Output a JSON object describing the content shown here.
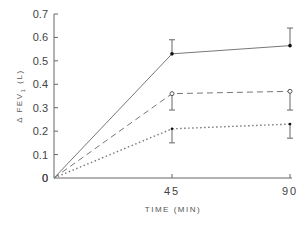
{
  "chart_data": {
    "type": "line",
    "title": "",
    "xlabel": "TIME (MIN)",
    "ylabel": "Δ FEV1 (L)",
    "x": [
      0,
      45,
      90
    ],
    "x_tick_labels": [
      "0",
      "45",
      "90"
    ],
    "y_tick_labels": [
      "0",
      "0.1",
      "0.2",
      "0.3",
      "0.4",
      "0.5",
      "0.6",
      "0.7"
    ],
    "xlim": [
      0,
      90
    ],
    "ylim": [
      0,
      0.7
    ],
    "grid": false,
    "legend": null,
    "series": [
      {
        "name": "solid (filled circles)",
        "style": "solid",
        "marker": "filled-circle",
        "values": [
          0,
          0.53,
          0.565
        ],
        "error_upper": [
          0,
          0.59,
          0.64
        ]
      },
      {
        "name": "dashed (open circles)",
        "style": "dashed",
        "marker": "open-circle",
        "values": [
          0,
          0.36,
          0.37
        ],
        "error_lower": [
          0,
          0.29,
          0.29
        ]
      },
      {
        "name": "dotted (small filled)",
        "style": "dotted",
        "marker": "small-filled",
        "values": [
          0,
          0.21,
          0.23
        ],
        "error_lower": [
          0,
          0.15,
          0.17
        ]
      }
    ]
  },
  "axes": {
    "x_title": "TIME (MIN)",
    "y_title_main": "Δ FEV",
    "y_title_sub": "1",
    "y_title_unit": "(L)"
  }
}
